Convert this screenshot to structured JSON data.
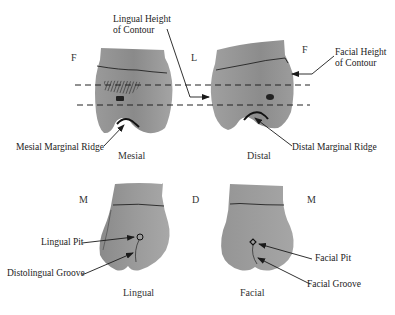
{
  "figure": {
    "views": [
      {
        "id": "mesial",
        "label": "Mesial",
        "orientation_left": "F",
        "orientation_right": "L"
      },
      {
        "id": "distal",
        "label": "Distal",
        "orientation_left": "L",
        "orientation_right": "F"
      },
      {
        "id": "lingual",
        "label": "Lingual",
        "orientation_left": "M",
        "orientation_right": "D"
      },
      {
        "id": "facial",
        "label": "Facial",
        "orientation_left": "D",
        "orientation_right": "M"
      }
    ],
    "annotations": {
      "lingual_height_of_contour": [
        "Lingual Height",
        "of Contour"
      ],
      "facial_height_of_contour": [
        "Facial Height",
        "of Contour"
      ],
      "mesial_marginal_ridge": "Mesial Marginal Ridge",
      "distal_marginal_ridge": "Distal Marginal Ridge",
      "lingual_pit": "Lingual Pit",
      "distolingual_groove": "Distolingual Groove",
      "facial_pit": "Facial Pit",
      "facial_groove": "Facial Groove"
    },
    "colors": {
      "tooth_fill": "#8e8e8e",
      "tooth_dark": "#6f6f6f",
      "line": "#1a1a1a"
    }
  }
}
